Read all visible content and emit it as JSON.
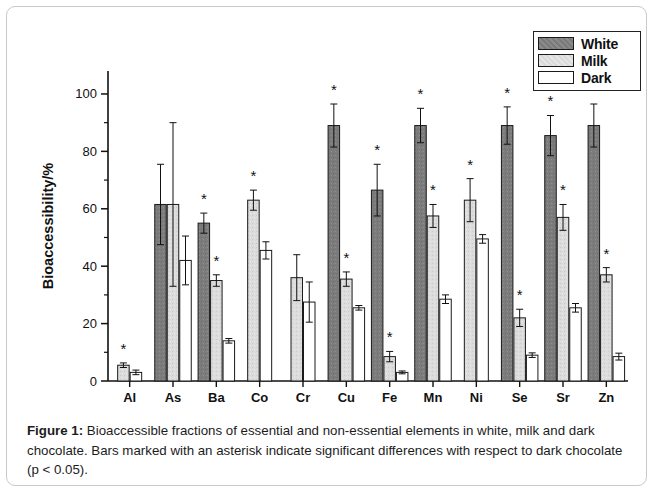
{
  "figure": {
    "caption_prefix": "Figure 1:",
    "caption_body": " Bioaccessible fractions of essential and non-essential elements in white, milk and dark chocolate. Bars marked with an asterisk indicate significant differences with respect to dark chocolate (p < 0.05)."
  },
  "legend": {
    "position": "top-right",
    "entries": [
      {
        "label": "White",
        "color": "#808080"
      },
      {
        "label": "Milk",
        "color": "#d9d9d9"
      },
      {
        "label": "Dark",
        "color": "#ffffff"
      }
    ]
  },
  "chart_data": {
    "type": "bar",
    "title": "",
    "subtitle": "",
    "xlabel": "",
    "ylabel": "Bioaccessibility/%",
    "ylim": [
      0,
      108
    ],
    "yticks": [
      0,
      20,
      40,
      60,
      80,
      100
    ],
    "ytick_labels": [
      "0",
      "20",
      "40",
      "60",
      "80",
      "100"
    ],
    "minor_ticks": true,
    "grid": false,
    "axis_style": "left-and-bottom-spines",
    "significance_marker": "*",
    "significance_note": "p < 0.05 vs dark chocolate",
    "categories": [
      "Al",
      "As",
      "Ba",
      "Co",
      "Cr",
      "Cu",
      "Fe",
      "Mn",
      "Ni",
      "Se",
      "Sr",
      "Zn"
    ],
    "series": [
      {
        "name": "White",
        "color": "#808080",
        "values": [
          null,
          61.5,
          55.0,
          null,
          null,
          89.0,
          66.5,
          89.0,
          null,
          89.0,
          85.5,
          89.0
        ],
        "err_upper": [
          null,
          14.0,
          3.5,
          null,
          null,
          7.5,
          9.0,
          6.0,
          null,
          6.5,
          7.0,
          7.5
        ],
        "err_lower": [
          null,
          14.0,
          3.5,
          null,
          null,
          7.5,
          9.0,
          6.0,
          null,
          6.5,
          7.0,
          7.5
        ],
        "significant": [
          false,
          false,
          true,
          false,
          false,
          true,
          true,
          true,
          false,
          true,
          true,
          true
        ]
      },
      {
        "name": "Milk",
        "color": "#d9d9d9",
        "values": [
          5.5,
          61.5,
          35.0,
          63.0,
          36.0,
          35.5,
          8.5,
          57.5,
          63.0,
          22.0,
          57.0,
          37.0
        ],
        "err_upper": [
          0.8,
          28.5,
          2.0,
          3.5,
          8.0,
          2.5,
          1.8,
          4.0,
          7.5,
          3.0,
          4.5,
          2.5
        ],
        "err_lower": [
          0.8,
          28.5,
          2.0,
          3.5,
          8.0,
          2.5,
          1.8,
          4.0,
          7.5,
          3.0,
          4.5,
          2.5
        ],
        "significant": [
          true,
          false,
          true,
          true,
          false,
          true,
          true,
          true,
          true,
          true,
          true,
          true
        ]
      },
      {
        "name": "Dark",
        "color": "#ffffff",
        "values": [
          3.0,
          42.0,
          14.0,
          45.5,
          27.5,
          25.5,
          3.0,
          28.5,
          49.5,
          9.0,
          25.5,
          8.5
        ],
        "err_upper": [
          0.8,
          8.5,
          0.8,
          3.0,
          7.0,
          0.8,
          0.5,
          1.5,
          1.5,
          0.8,
          1.5,
          1.2
        ],
        "err_lower": [
          0.8,
          8.5,
          0.8,
          3.0,
          7.0,
          0.8,
          0.5,
          1.5,
          1.5,
          0.8,
          1.5,
          1.2
        ],
        "significant": [
          false,
          false,
          false,
          false,
          false,
          false,
          false,
          false,
          false,
          false,
          false,
          false
        ]
      }
    ]
  }
}
